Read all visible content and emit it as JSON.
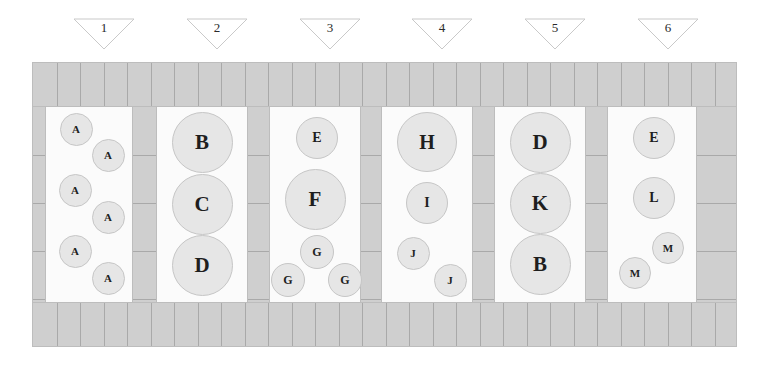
{
  "diagram": {
    "colors": {
      "wall": "#cfcfcf",
      "wall_border": "#bdbdbd",
      "brick_line": "#a9a9a9",
      "lane_floor": "#fbfbfb",
      "vehicle_fill": "#e6e6e6",
      "vehicle_border": "#c6c6c6",
      "label_text": "#1e1e1e",
      "page_background": "#ffffff"
    },
    "entrance_markers": [
      {
        "label": "1",
        "icon": "triangle-down-icon",
        "cx": 104
      },
      {
        "label": "2",
        "icon": "triangle-down-icon",
        "cx": 217
      },
      {
        "label": "3",
        "icon": "triangle-down-icon",
        "cx": 330
      },
      {
        "label": "4",
        "icon": "triangle-down-icon",
        "cx": 442
      },
      {
        "label": "5",
        "icon": "triangle-down-icon",
        "cx": 555
      },
      {
        "label": "6",
        "icon": "triangle-down-icon",
        "cx": 668
      }
    ],
    "lanes": [
      {
        "index": 1,
        "x": 14,
        "width": 86,
        "vehicles": [
          {
            "label": "A",
            "cx": 30,
            "cy": 22,
            "d": 33
          },
          {
            "label": "A",
            "cx": 62,
            "cy": 48,
            "d": 33
          },
          {
            "label": "A",
            "cx": 29,
            "cy": 83,
            "d": 33
          },
          {
            "label": "A",
            "cx": 62,
            "cy": 110,
            "d": 33
          },
          {
            "label": "A",
            "cx": 29,
            "cy": 144,
            "d": 33
          },
          {
            "label": "A",
            "cx": 62,
            "cy": 171,
            "d": 33
          }
        ]
      },
      {
        "index": 2,
        "x": 125,
        "width": 90,
        "vehicles": [
          {
            "label": "B",
            "cx": 45,
            "cy": 35,
            "d": 61
          },
          {
            "label": "C",
            "cx": 45,
            "cy": 97,
            "d": 61
          },
          {
            "label": "D",
            "cx": 45,
            "cy": 158,
            "d": 61
          }
        ]
      },
      {
        "index": 3,
        "x": 238,
        "width": 90,
        "vehicles": [
          {
            "label": "E",
            "cx": 47,
            "cy": 31,
            "d": 42
          },
          {
            "label": "F",
            "cx": 45,
            "cy": 92,
            "d": 61
          },
          {
            "label": "G",
            "cx": 47,
            "cy": 145,
            "d": 34
          },
          {
            "label": "G",
            "cx": 18,
            "cy": 173,
            "d": 34
          },
          {
            "label": "G",
            "cx": 75,
            "cy": 173,
            "d": 34
          }
        ]
      },
      {
        "index": 4,
        "x": 350,
        "width": 90,
        "vehicles": [
          {
            "label": "H",
            "cx": 45,
            "cy": 35,
            "d": 60
          },
          {
            "label": "I",
            "cx": 45,
            "cy": 96,
            "d": 42
          },
          {
            "label": "J",
            "cx": 31,
            "cy": 146,
            "d": 33
          },
          {
            "label": "J",
            "cx": 68,
            "cy": 173,
            "d": 33
          }
        ]
      },
      {
        "index": 5,
        "x": 463,
        "width": 90,
        "vehicles": [
          {
            "label": "D",
            "cx": 45,
            "cy": 35,
            "d": 61
          },
          {
            "label": "K",
            "cx": 45,
            "cy": 96,
            "d": 61
          },
          {
            "label": "B",
            "cx": 45,
            "cy": 157,
            "d": 61
          }
        ]
      },
      {
        "index": 6,
        "x": 576,
        "width": 88,
        "vehicles": [
          {
            "label": "E",
            "cx": 46,
            "cy": 31,
            "d": 42
          },
          {
            "label": "L",
            "cx": 46,
            "cy": 91,
            "d": 42
          },
          {
            "label": "M",
            "cx": 60,
            "cy": 141,
            "d": 32
          },
          {
            "label": "M",
            "cx": 27,
            "cy": 166,
            "d": 32
          }
        ]
      }
    ],
    "pillars": [
      {
        "x": 0,
        "width": 14
      },
      {
        "x": 100,
        "width": 25
      },
      {
        "x": 215,
        "width": 23
      },
      {
        "x": 328,
        "width": 22
      },
      {
        "x": 440,
        "width": 23
      },
      {
        "x": 553,
        "width": 23
      },
      {
        "x": 664,
        "width": 41
      }
    ]
  }
}
